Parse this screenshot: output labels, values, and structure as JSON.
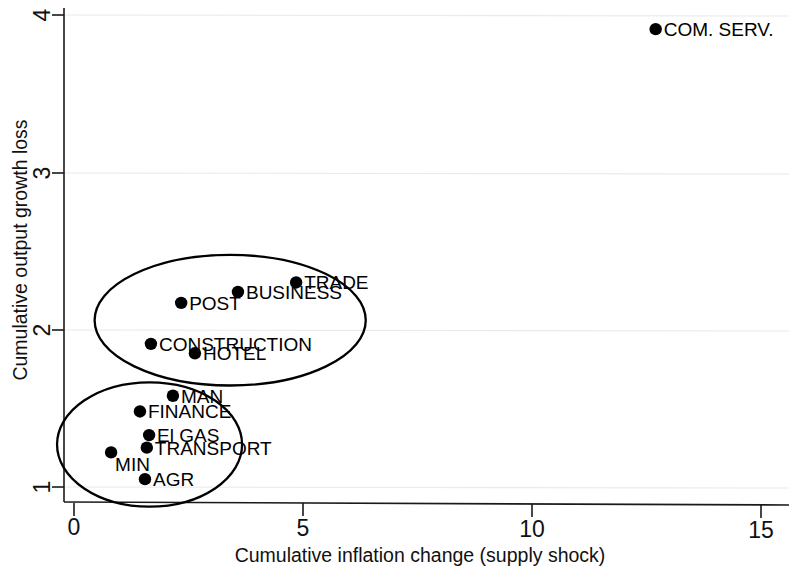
{
  "chart_data": {
    "type": "scatter",
    "title": "",
    "xlabel": "Cumulative inflation change (supply shock)",
    "ylabel": "Cumulative output growth loss",
    "xlim": [
      0,
      15.5
    ],
    "ylim": [
      0.9,
      4.05
    ],
    "xticks": [
      0,
      5,
      10,
      15
    ],
    "xticklabels": [
      "0",
      "5",
      "10",
      "15"
    ],
    "yticks": [
      1,
      2,
      3,
      4
    ],
    "yticklabels": [
      "1",
      "2",
      "3",
      "4"
    ],
    "grid": "faint horizontal gridlines at y = 2, 3, 4",
    "legend": "none",
    "points": [
      {
        "label": "COM. SERV.",
        "x": 12.7,
        "y": 3.91,
        "label_side": "right"
      },
      {
        "label": "TRADE",
        "x": 4.85,
        "y": 2.3,
        "label_side": "right"
      },
      {
        "label": "BUSINESS",
        "x": 3.58,
        "y": 2.24,
        "label_side": "right"
      },
      {
        "label": "POST",
        "x": 2.34,
        "y": 2.17,
        "label_side": "right"
      },
      {
        "label": "CONSTRUCTION",
        "x": 1.68,
        "y": 1.91,
        "label_side": "right"
      },
      {
        "label": "HOTEL",
        "x": 2.64,
        "y": 1.85,
        "label_side": "right"
      },
      {
        "label": "MAN",
        "x": 2.16,
        "y": 1.58,
        "label_side": "right"
      },
      {
        "label": "FINANCE",
        "x": 1.44,
        "y": 1.48,
        "label_side": "right"
      },
      {
        "label": "El GAS",
        "x": 1.64,
        "y": 1.33,
        "label_side": "right"
      },
      {
        "label": "TRANSPORT",
        "x": 1.59,
        "y": 1.25,
        "label_side": "right"
      },
      {
        "label": "MIN",
        "x": 0.81,
        "y": 1.22,
        "label_side": "below-right"
      },
      {
        "label": "AGR",
        "x": 1.55,
        "y": 1.05,
        "label_side": "right"
      }
    ],
    "annotations": [
      {
        "kind": "ellipse",
        "name": "upper-cluster",
        "members": [
          "TRADE",
          "BUSINESS",
          "POST",
          "CONSTRUCTION",
          "HOTEL"
        ],
        "center_x": 3.41,
        "center_y": 2.06,
        "radius_x": 2.96,
        "radius_y": 0.415
      },
      {
        "kind": "ellipse",
        "name": "lower-cluster",
        "members": [
          "MAN",
          "FINANCE",
          "El GAS",
          "TRANSPORT",
          "MIN",
          "AGR"
        ],
        "center_x": 1.65,
        "center_y": 1.27,
        "radius_x": 2.02,
        "radius_y": 0.395
      }
    ]
  },
  "axes": {
    "x_title": "Cumulative inflation change (supply shock)",
    "y_title": "Cumulative output growth loss",
    "x_tick_0": "0",
    "x_tick_1": "5",
    "x_tick_2": "10",
    "x_tick_3": "15",
    "y_tick_0": "1",
    "y_tick_1": "2",
    "y_tick_2": "3",
    "y_tick_3": "4"
  },
  "labels": {
    "p0": "COM. SERV.",
    "p1": "TRADE",
    "p2": "BUSINESS",
    "p3": "POST",
    "p4": "CONSTRUCTION",
    "p5": "HOTEL",
    "p6": "MAN",
    "p7": "FINANCE",
    "p8": "El GAS",
    "p9": "TRANSPORT",
    "p10": "MIN",
    "p11": "AGR"
  },
  "colors": {
    "marker": "#000000",
    "axis": "#1a1a1a",
    "grid": "#e9e9ee",
    "background": "#ffffff"
  }
}
